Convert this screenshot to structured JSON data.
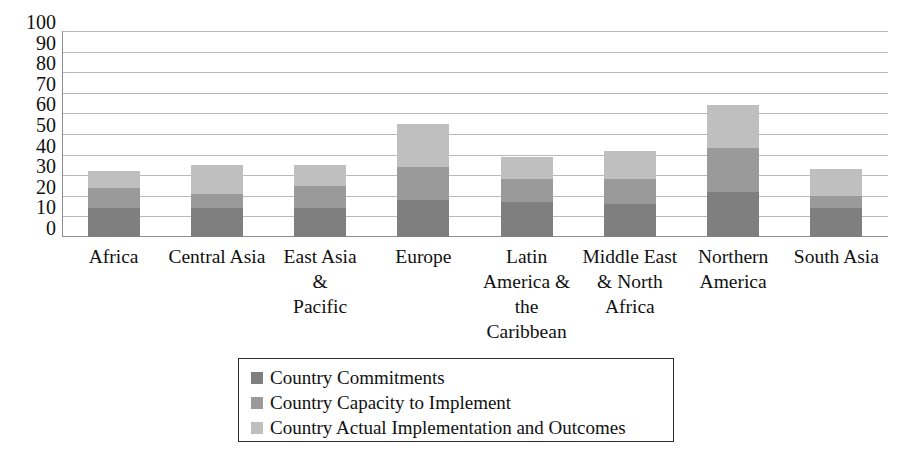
{
  "chart_data": {
    "type": "bar",
    "subtype": "stacked-column",
    "title": "",
    "xlabel": "",
    "ylabel": "",
    "ylim": [
      0,
      100
    ],
    "y_ticks": [
      0,
      10,
      20,
      30,
      40,
      50,
      60,
      70,
      80,
      90,
      100
    ],
    "y_tick_labels": [
      "0",
      "10",
      "20",
      "30",
      "40",
      "50",
      "60",
      "70",
      "80",
      "90",
      "100"
    ],
    "grid": true,
    "legend_position": "bottom",
    "categories": [
      "Africa",
      "Central Asia",
      "East Asia & Pacific",
      "Europe",
      "Latin America & the Caribbean",
      "Middle East & North Africa",
      "Northern America",
      "South Asia"
    ],
    "category_label_lines": [
      [
        "Africa"
      ],
      [
        "Central Asia"
      ],
      [
        "East Asia",
        "&",
        "Pacific"
      ],
      [
        "Europe"
      ],
      [
        "Latin",
        "America &",
        "the",
        "Caribbean"
      ],
      [
        "Middle East",
        "& North",
        "Africa"
      ],
      [
        "Northern",
        "America"
      ],
      [
        "South Asia"
      ]
    ],
    "series": [
      {
        "name": "Country Commitments",
        "color": "#7f7f7f",
        "values": [
          14,
          14,
          14,
          18,
          17,
          16,
          22,
          14
        ]
      },
      {
        "name": "Country Capacity to Implement",
        "color": "#9a9a9a",
        "values": [
          10,
          7,
          11,
          16,
          11,
          12,
          21,
          6
        ]
      },
      {
        "name": "Country Actual Implementation and Outcomes",
        "color": "#bfbfbf",
        "values": [
          8,
          14,
          10,
          21,
          11,
          14,
          21,
          13
        ]
      }
    ],
    "stack_totals": [
      32,
      35,
      35,
      55,
      39,
      42,
      64,
      33
    ]
  },
  "legend": {
    "items": [
      {
        "label": "Country Commitments",
        "color": "#7f7f7f"
      },
      {
        "label": "Country Capacity to Implement",
        "color": "#9a9a9a"
      },
      {
        "label": "Country Actual Implementation and Outcomes",
        "color": "#bfbfbf"
      }
    ]
  }
}
